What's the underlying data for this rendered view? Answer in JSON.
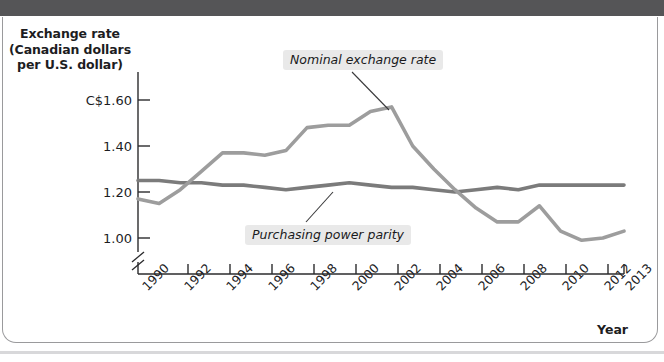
{
  "figure": {
    "background_color": "#ffffff",
    "frame_color": "#9a9a9c",
    "top_band_color": "#555557"
  },
  "chart_data": {
    "type": "line",
    "title": "",
    "ylabel": "Exchange rate (Canadian dollars per U.S. dollar)",
    "ylabel_lines": [
      "Exchange rate",
      "(Canadian dollars",
      "per U.S. dollar)"
    ],
    "xlabel": "Year",
    "x": [
      1990,
      1991,
      1992,
      1993,
      1994,
      1995,
      1996,
      1997,
      1998,
      1999,
      2000,
      2001,
      2002,
      2003,
      2004,
      2005,
      2006,
      2007,
      2008,
      2009,
      2010,
      2011,
      2012,
      2013
    ],
    "xlim": [
      1990,
      2013
    ],
    "ylim": [
      0.92,
      1.68
    ],
    "ytick_values": [
      1.0,
      1.2,
      1.4,
      1.6
    ],
    "ytick_labels": [
      "1.00",
      "1.20",
      "1.40",
      "C$1.60"
    ],
    "xtick_values": [
      1990,
      1992,
      1994,
      1996,
      1998,
      2000,
      2002,
      2004,
      2006,
      2008,
      2010,
      2012,
      2013
    ],
    "xtick_labels": [
      "1990",
      "1992",
      "1994",
      "1996",
      "1998",
      "2000",
      "2002",
      "2004",
      "2006",
      "2008",
      "2010",
      "2012",
      "2013"
    ],
    "grid": false,
    "legend_position": "inline-annotations",
    "axis_break": true,
    "series": [
      {
        "name": "Nominal exchange rate",
        "color": "#9d9d9d",
        "label_x_px": 283,
        "label_y_px": 50,
        "leader_from_px": [
          352,
          72
        ],
        "leader_to_px": [
          389,
          110
        ],
        "values": [
          1.17,
          1.15,
          1.21,
          1.29,
          1.37,
          1.37,
          1.36,
          1.38,
          1.48,
          1.49,
          1.49,
          1.55,
          1.57,
          1.4,
          1.3,
          1.21,
          1.13,
          1.07,
          1.07,
          1.14,
          1.03,
          0.99,
          1.0,
          1.03
        ]
      },
      {
        "name": "Purchasing power parity",
        "color": "#7b7b7b",
        "label_x_px": 245,
        "label_y_px": 225,
        "leader_from_px": [
          306,
          222
        ],
        "leader_to_px": [
          333,
          192
        ],
        "values": [
          1.25,
          1.25,
          1.24,
          1.24,
          1.23,
          1.23,
          1.22,
          1.21,
          1.22,
          1.23,
          1.24,
          1.23,
          1.22,
          1.22,
          1.21,
          1.2,
          1.21,
          1.22,
          1.21,
          1.23,
          1.23,
          1.23,
          1.23,
          1.23
        ]
      }
    ]
  }
}
